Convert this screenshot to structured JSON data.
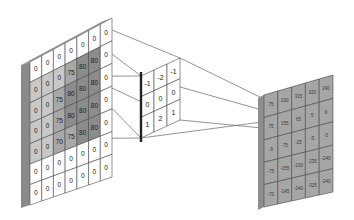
{
  "diagram": {
    "input": {
      "rows": 7,
      "cols": 7,
      "values": [
        [
          "0",
          "0",
          "0",
          "0",
          "0",
          "0",
          "0"
        ],
        [
          "0",
          "0",
          "0",
          "75",
          "80",
          "80",
          "0"
        ],
        [
          "0",
          "0",
          "75",
          "80",
          "80",
          "80",
          "0"
        ],
        [
          "0",
          "0",
          "75",
          "80",
          "80",
          "80",
          "0"
        ],
        [
          "0",
          "0",
          "70",
          "75",
          "80",
          "80",
          "0"
        ],
        [
          "0",
          "0",
          "0",
          "0",
          "0",
          "0",
          "0"
        ],
        [
          "0",
          "0",
          "0",
          "0",
          "0",
          "0",
          "0"
        ]
      ],
      "highlight_window": {
        "row": 1,
        "col": 1,
        "size": 3
      }
    },
    "kernel": {
      "rows": 3,
      "cols": 3,
      "values": [
        [
          "-1",
          "-2",
          "-1"
        ],
        [
          "0",
          "0",
          "0"
        ],
        [
          "1",
          "2",
          "1"
        ]
      ]
    },
    "output": {
      "rows": 5,
      "cols": 5,
      "values": [
        [
          "75",
          "230",
          "315",
          "320",
          "240"
        ],
        [
          "75",
          "155",
          "65",
          "5",
          "0"
        ],
        [
          "-5",
          "-75",
          "-25",
          "-5",
          "-5"
        ],
        [
          "-75",
          "-155",
          "-230",
          "-235",
          "-240"
        ],
        [
          "-70",
          "-145",
          "-240",
          "-325",
          "-240"
        ]
      ]
    },
    "colors": {
      "cell_white": "#ffffff",
      "cell_light_gray": "#c8c8c8",
      "cell_mid_gray": "#a8a8a8",
      "cell_dark_gray": "#8c8c8c",
      "side_face": "#8a8a8a",
      "output_cell": "#a6a6a6",
      "grid_line": "#555555",
      "projection_line": "#666666"
    }
  }
}
